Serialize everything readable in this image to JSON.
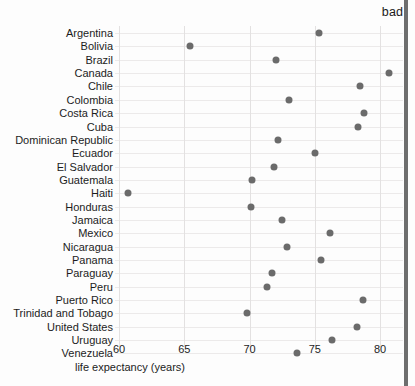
{
  "annotation": {
    "bad_label": "bad"
  },
  "chart_data": {
    "type": "scatter",
    "title": "",
    "xlabel": "life expectancy (years)",
    "ylabel": "",
    "xlim": [
      58.5,
      82.5
    ],
    "xticks": [
      60,
      65,
      70,
      75,
      80
    ],
    "xticklabels": [
      "60",
      "65",
      "70",
      "75",
      "80"
    ],
    "grid": "both",
    "legend": "none",
    "orientation": "horizontal-dotplot",
    "marker": {
      "shape": "circle",
      "color": "#6b6b6b",
      "size": 7
    },
    "categories": [
      "Argentina",
      "Bolivia",
      "Brazil",
      "Canada",
      "Chile",
      "Colombia",
      "Costa Rica",
      "Cuba",
      "Dominican Republic",
      "Ecuador",
      "El Salvador",
      "Guatemala",
      "Haiti",
      "Honduras",
      "Jamaica",
      "Mexico",
      "Nicaragua",
      "Panama",
      "Paraguay",
      "Peru",
      "Puerto Rico",
      "Trinidad and Tobago",
      "United States",
      "Uruguay",
      "Venezuela"
    ],
    "values": [
      75.3,
      65.4,
      72.0,
      80.7,
      78.5,
      73.0,
      78.8,
      78.3,
      72.2,
      75.0,
      71.9,
      70.2,
      60.7,
      70.1,
      72.5,
      76.2,
      72.9,
      75.5,
      71.7,
      71.3,
      78.7,
      69.8,
      78.2,
      76.3,
      73.6
    ]
  }
}
